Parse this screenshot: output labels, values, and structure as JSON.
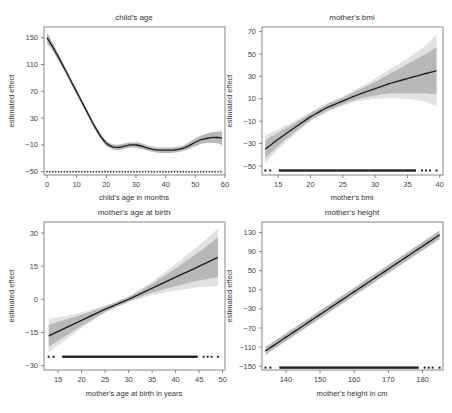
{
  "chart_data": [
    {
      "type": "line",
      "title": "child's age",
      "xlabel": "child's age in months",
      "ylabel": "estimated effect",
      "xticks": [
        0,
        10,
        20,
        30,
        40,
        50,
        60
      ],
      "yticks": [
        -50,
        -10,
        30,
        70,
        110,
        150
      ],
      "xlim": [
        -1,
        60
      ],
      "ylim": [
        -55,
        166
      ],
      "x": [
        0,
        2,
        4,
        6,
        8,
        10,
        12,
        14,
        16,
        18,
        20,
        22,
        24,
        26,
        28,
        30,
        32,
        34,
        36,
        38,
        40,
        42,
        44,
        46,
        48,
        50,
        52,
        54,
        56,
        58,
        59
      ],
      "values": [
        150,
        136,
        120,
        103,
        86,
        69,
        52,
        35,
        18,
        3,
        -8,
        -13,
        -14,
        -12,
        -10,
        -10,
        -12,
        -15,
        -17,
        -18,
        -18,
        -18,
        -17,
        -15,
        -11,
        -6,
        -2,
        0,
        1,
        1,
        0
      ],
      "ci_halfwidth": [
        8,
        6,
        5,
        4,
        4,
        4,
        4,
        4,
        4,
        4,
        4,
        4,
        4,
        4,
        4,
        4,
        4,
        4,
        4,
        4,
        4,
        4,
        4,
        4,
        5,
        6,
        6,
        7,
        8,
        9,
        10
      ],
      "rug_y": -50,
      "grid": false
    },
    {
      "type": "line",
      "title": "mother's bmi",
      "xlabel": "mother's bmi",
      "ylabel": "estimated effect",
      "xticks": [
        15,
        20,
        25,
        30,
        35,
        40
      ],
      "yticks": [
        -50,
        -30,
        -10,
        10,
        30,
        50,
        70
      ],
      "xlim": [
        12.5,
        40.5
      ],
      "ylim": [
        -58,
        74
      ],
      "x": [
        13,
        15,
        17.5,
        20,
        22.5,
        25,
        27.5,
        30,
        32.5,
        35,
        37.5,
        39.5
      ],
      "values": [
        -35,
        -26,
        -16,
        -6,
        2,
        8,
        14,
        19,
        24,
        28,
        32,
        35
      ],
      "ci_inner_halfwidth": [
        8,
        6,
        4,
        3,
        3,
        3,
        4,
        6,
        9,
        13,
        17,
        21
      ],
      "ci_outer_halfwidth": [
        12,
        9,
        6,
        4,
        4,
        4,
        6,
        9,
        13,
        18,
        24,
        32
      ],
      "rug_y": -54,
      "grid": false
    },
    {
      "type": "line",
      "title": "mother's age at birth",
      "xlabel": "mother's age at birth in years",
      "ylabel": "estimated effect",
      "xticks": [
        15,
        20,
        25,
        30,
        35,
        40,
        45,
        50
      ],
      "yticks": [
        -30,
        15,
        0,
        -15,
        30
      ],
      "yticks_sorted": [
        -30,
        -15,
        0,
        15,
        30
      ],
      "xlim": [
        12,
        50.5
      ],
      "ylim": [
        -32,
        35
      ],
      "x": [
        13,
        20,
        25,
        30,
        35,
        40,
        45,
        49
      ],
      "values": [
        -16.5,
        -9.5,
        -4.5,
        0,
        5,
        10,
        15,
        19
      ],
      "ci_inner_halfwidth": [
        5,
        2.5,
        1.2,
        1,
        2,
        4,
        6.5,
        9
      ],
      "ci_outer_halfwidth": [
        7.5,
        3.5,
        1.6,
        1.3,
        3,
        6,
        9.5,
        13
      ],
      "rug_y": -26,
      "grid": false
    },
    {
      "type": "line",
      "title": "mother's height",
      "xlabel": "mother's height in cm",
      "ylabel": "estimated effect",
      "xticks": [
        140,
        150,
        160,
        170,
        180
      ],
      "yticks": [
        -150,
        -110,
        -70,
        -30,
        10,
        50,
        90,
        130
      ],
      "xlim": [
        133,
        186
      ],
      "ylim": [
        -158,
        152
      ],
      "x": [
        134,
        185
      ],
      "values": [
        -118,
        125
      ],
      "ci_halfwidth": [
        8,
        9
      ],
      "rug_y": -153,
      "grid": false
    }
  ],
  "panels": {
    "p1": {
      "title": "child's age",
      "xlabel": "child's age in months",
      "ylabel": "estimated effect"
    },
    "p2": {
      "title": "mother's bmi",
      "xlabel": "mother's bmi",
      "ylabel": "estimated effect"
    },
    "p3": {
      "title": "mother's age at birth",
      "xlabel": "mother's age at birth in years",
      "ylabel": "estimated effect"
    },
    "p4": {
      "title": "mother's height",
      "xlabel": "mother's height in cm",
      "ylabel": "estimated effect"
    }
  },
  "colors": {
    "line": "#1a1a1a",
    "ci_inner": "#b8b8b8",
    "ci_outer": "#e2e2e2",
    "axis": "#555555"
  }
}
